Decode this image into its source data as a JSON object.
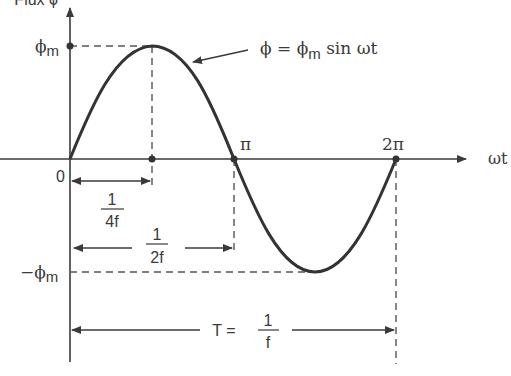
{
  "diagram": {
    "type": "sinusoidal-flux-waveform",
    "y_axis_label": "Flux ϕ",
    "x_axis_label": "ωt",
    "origin_label": "0",
    "peak_label": "ϕ",
    "peak_sub": "m",
    "trough_label": "−ϕ",
    "trough_sub": "m",
    "pi_label": "π",
    "two_pi_label": "2π",
    "equation": {
      "lhs": "ϕ = ϕ",
      "sub": "m",
      "rhs": " sin ωt"
    },
    "quarter_period": {
      "numerator": "1",
      "denominator": "4f"
    },
    "half_period": {
      "numerator": "1",
      "denominator": "2f"
    },
    "full_period": {
      "prefix": "T = ",
      "numerator": "1",
      "denominator": "f"
    }
  },
  "colors": {
    "line": "#3a3a3a",
    "curve": "#333333",
    "background": "#ffffff"
  }
}
